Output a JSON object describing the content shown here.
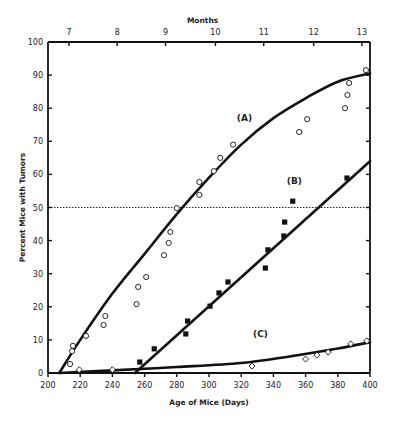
{
  "chart_data": {
    "type": "scatter",
    "title": "",
    "xlabel": "Age of Mice (Days)",
    "ylabel": "Percent Mice with Tumors",
    "x2label": "Months",
    "xlim": [
      200,
      400
    ],
    "ylim": [
      0,
      100
    ],
    "x_ticks": [
      200,
      220,
      240,
      260,
      280,
      300,
      320,
      340,
      360,
      380,
      400
    ],
    "y_ticks": [
      0,
      10,
      20,
      30,
      40,
      50,
      60,
      70,
      80,
      90,
      100
    ],
    "x2_ticks": [
      {
        "label": "7",
        "day": 213
      },
      {
        "label": "8",
        "day": 243
      },
      {
        "label": "9",
        "day": 273
      },
      {
        "label": "10",
        "day": 304
      },
      {
        "label": "11",
        "day": 334
      },
      {
        "label": "12",
        "day": 365
      },
      {
        "label": "13",
        "day": 395
      }
    ],
    "grid": false,
    "reference_line": {
      "y": 50,
      "style": "dotted"
    },
    "series": [
      {
        "name": "(A)",
        "marker": "open-circle",
        "points": [
          [
            213.7,
            2.7
          ],
          [
            215,
            6.6
          ],
          [
            215.5,
            8.2
          ],
          [
            223.6,
            11.2
          ],
          [
            234.5,
            14.5
          ],
          [
            235.6,
            17.2
          ],
          [
            255,
            20.8
          ],
          [
            256,
            26
          ],
          [
            261,
            29
          ],
          [
            272,
            35.6
          ],
          [
            275,
            39.3
          ],
          [
            276,
            42.6
          ],
          [
            280,
            49.8
          ],
          [
            294,
            53.8
          ],
          [
            294,
            57.7
          ],
          [
            303,
            61
          ],
          [
            307,
            65
          ],
          [
            315,
            69
          ],
          [
            356,
            72.8
          ],
          [
            361,
            76.7
          ],
          [
            384.5,
            80
          ],
          [
            386,
            84
          ],
          [
            387,
            87.6
          ],
          [
            397.5,
            91.5
          ]
        ],
        "fit_curve": [
          [
            207,
            0
          ],
          [
            220,
            10
          ],
          [
            240,
            24
          ],
          [
            260,
            36
          ],
          [
            280,
            48
          ],
          [
            300,
            59
          ],
          [
            320,
            69
          ],
          [
            340,
            77
          ],
          [
            360,
            83
          ],
          [
            380,
            88
          ],
          [
            400,
            90.5
          ]
        ],
        "label_pos": [
          322,
          76
        ]
      },
      {
        "name": "(B)",
        "marker": "filled-square",
        "points": [
          [
            257,
            3.3
          ],
          [
            266,
            7.3
          ],
          [
            285.6,
            11.8
          ],
          [
            286.7,
            15.7
          ],
          [
            300.6,
            20.2
          ],
          [
            306.2,
            24.2
          ],
          [
            311.8,
            27.5
          ],
          [
            335,
            31.7
          ],
          [
            336.6,
            37.2
          ],
          [
            346.5,
            41.4
          ],
          [
            347,
            45.6
          ],
          [
            352,
            51.9
          ],
          [
            385.7,
            58.9
          ]
        ],
        "fit_curve": [
          [
            254,
            0
          ],
          [
            400,
            64
          ]
        ],
        "label_pos": [
          353,
          57
        ]
      },
      {
        "name": "(C)",
        "marker": "open-diamond",
        "points": [
          [
            219.4,
            1
          ],
          [
            240,
            1
          ],
          [
            326.7,
            2.1
          ],
          [
            360,
            4.2
          ],
          [
            367,
            5.4
          ],
          [
            374,
            6.3
          ],
          [
            388,
            8.8
          ],
          [
            398,
            9.7
          ]
        ],
        "fit_curve": [
          [
            207,
            0
          ],
          [
            240,
            0.8
          ],
          [
            280,
            1.8
          ],
          [
            320,
            3
          ],
          [
            350,
            5
          ],
          [
            380,
            7.4
          ],
          [
            400,
            9.3
          ]
        ],
        "label_pos": [
          332,
          11
        ]
      }
    ]
  },
  "colors": {
    "ink": "#111111",
    "background": "#ffffff"
  }
}
